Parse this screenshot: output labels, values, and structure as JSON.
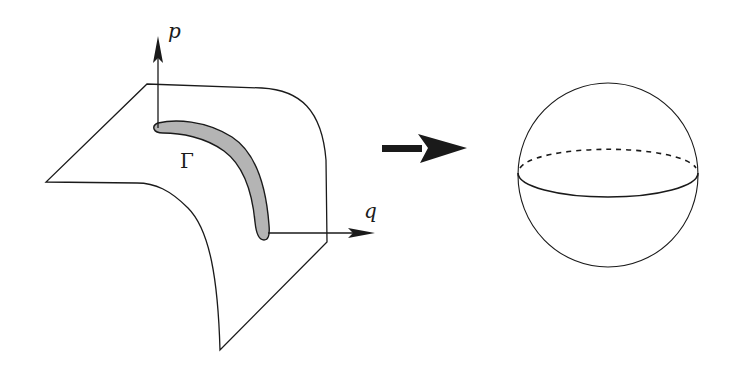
{
  "diagram": {
    "left_panel": {
      "description": "curved surface in phase space with region Gamma",
      "axis_vertical_label": "p",
      "axis_horizontal_label": "q",
      "region_label": "Γ",
      "region_fill": "#b4b4b4"
    },
    "transition_arrow": {
      "direction": "right"
    },
    "right_panel": {
      "description": "sphere with equator, back half dashed"
    },
    "colors": {
      "stroke": "#1a1a1a",
      "background": "#ffffff",
      "region_fill": "#b4b4b4"
    }
  }
}
